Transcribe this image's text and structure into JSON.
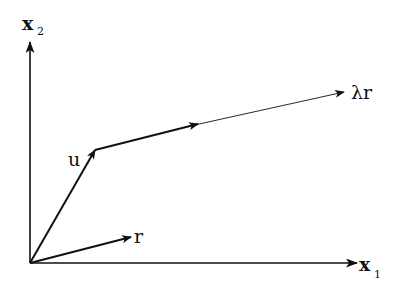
{
  "diagram": {
    "type": "vector-diagram",
    "axes": {
      "x1": {
        "label": "x",
        "subscript": "1"
      },
      "x2": {
        "label": "x",
        "subscript": "2"
      }
    },
    "vectors": [
      {
        "name": "u",
        "label": "u",
        "from": "origin",
        "to": "u-tip",
        "style": "thick"
      },
      {
        "name": "r",
        "label": "r",
        "from": "origin",
        "to": "r-tip",
        "style": "thick"
      },
      {
        "name": "u-plus-r",
        "label": "",
        "from": "u-tip",
        "to": "u+r",
        "style": "thick"
      },
      {
        "name": "ray",
        "label": "λr",
        "from": "u+r",
        "to": "u+λr",
        "style": "thin"
      }
    ],
    "labels": {
      "u": "u",
      "r": "r",
      "lambda_r": "λr",
      "x1_main": "x",
      "x1_sub": "1",
      "x2_main": "x",
      "x2_sub": "2"
    },
    "colors": {
      "stroke": "#111111",
      "background": "#ffffff"
    }
  }
}
